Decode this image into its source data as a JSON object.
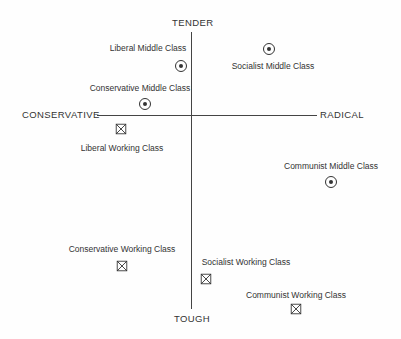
{
  "axes": {
    "top": "TENDER",
    "bottom": "TOUGH",
    "left": "CONSERVATIVE",
    "right": "RADICAL"
  },
  "legend_markers": {
    "middle_class": "circled-dot-icon",
    "working_class": "crossed-square-icon"
  },
  "points": [
    {
      "id": "liberal-middle",
      "label": "Liberal Middle Class",
      "marker": "circle",
      "x": 181,
      "y": 66,
      "lx": 148,
      "ly": 43
    },
    {
      "id": "socialist-middle",
      "label": "Socialist Middle Class",
      "marker": "circle",
      "x": 269,
      "y": 49,
      "lx": 273,
      "ly": 61
    },
    {
      "id": "conservative-middle",
      "label": "Conservative Middle Class",
      "marker": "circle",
      "x": 145,
      "y": 104,
      "lx": 140,
      "ly": 83
    },
    {
      "id": "liberal-working",
      "label": "Liberal Working Class",
      "marker": "square",
      "x": 121,
      "y": 129,
      "lx": 122,
      "ly": 143
    },
    {
      "id": "communist-middle",
      "label": "Communist Middle Class",
      "marker": "circle",
      "x": 331,
      "y": 182,
      "lx": 331,
      "ly": 161
    },
    {
      "id": "conservative-working",
      "label": "Conservative Working Class",
      "marker": "square",
      "x": 122,
      "y": 266,
      "lx": 122,
      "ly": 244
    },
    {
      "id": "socialist-working",
      "label": "Socialist Working Class",
      "marker": "square",
      "x": 206,
      "y": 279,
      "lx": 246,
      "ly": 257
    },
    {
      "id": "communist-working",
      "label": "Communist Working Class",
      "marker": "square",
      "x": 296,
      "y": 309,
      "lx": 296,
      "ly": 290
    }
  ]
}
